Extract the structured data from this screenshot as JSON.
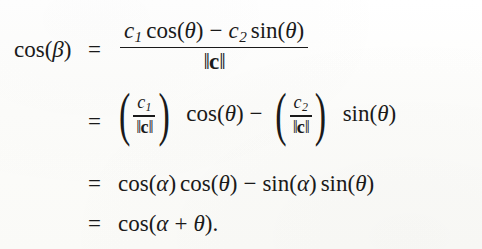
{
  "document": {
    "type": "mathematical-derivation",
    "background_color": "#fdfdfb",
    "text_color": "#1a1a1a",
    "description": "Four-line aligned derivation showing cos(beta) simplifies to cos(alpha + theta)"
  },
  "equation": {
    "lhs": {
      "cos": "cos",
      "open_paren": "(",
      "beta": "β",
      "close_paren": ")"
    },
    "equals": "=",
    "lines": [
      {
        "id": "line-1",
        "equals": "=",
        "numerator": {
          "c1": "c",
          "c1_sub": "1",
          "cos": "cos",
          "theta_open": "(",
          "theta": "θ",
          "theta_close": ")",
          "minus": "−",
          "c2": "c",
          "c2_sub": "2",
          "sin": "sin",
          "theta2_open": "(",
          "theta2": "θ",
          "theta2_close": ")"
        },
        "denominator": {
          "left_bars": "‖",
          "vector": "c",
          "right_bars": "‖"
        }
      },
      {
        "id": "line-2",
        "equals": "=",
        "first_term": {
          "open_paren": "(",
          "num_c": "c",
          "num_sub": "1",
          "den_left_bars": "‖",
          "den_vector": "c",
          "den_right_bars": "‖",
          "close_paren": ")",
          "fn": "cos",
          "arg_open": "(",
          "arg": "θ",
          "arg_close": ")"
        },
        "operator": "−",
        "second_term": {
          "open_paren": "(",
          "num_c": "c",
          "num_sub": "2",
          "den_left_bars": "‖",
          "den_vector": "c",
          "den_right_bars": "‖",
          "close_paren": ")",
          "fn": "sin",
          "arg_open": "(",
          "arg": "θ",
          "arg_close": ")"
        }
      },
      {
        "id": "line-3",
        "equals": "=",
        "cos_alpha": {
          "fn": "cos",
          "open": "(",
          "arg": "α",
          "close": ")"
        },
        "cos_theta": {
          "fn": "cos",
          "open": "(",
          "arg": "θ",
          "close": ")"
        },
        "operator": "−",
        "sin_alpha": {
          "fn": "sin",
          "open": "(",
          "arg": "α",
          "close": ")"
        },
        "sin_theta": {
          "fn": "sin",
          "open": "(",
          "arg": "θ",
          "close": ")"
        }
      },
      {
        "id": "line-4",
        "equals": "=",
        "result": {
          "fn": "cos",
          "open": "(",
          "alpha": "α",
          "plus": "+",
          "theta": "θ",
          "close": ")",
          "period": "."
        }
      }
    ]
  }
}
